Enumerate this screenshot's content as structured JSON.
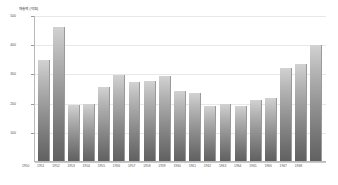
{
  "chart_data": {
    "type": "bar",
    "title": "",
    "xlabel": "",
    "ylabel": "매출액 (억원)",
    "ylim": [
      0,
      500
    ],
    "grid": true,
    "legend": "none",
    "yticks": [
      500,
      400,
      300,
      200,
      100
    ],
    "categories": [
      "1950",
      "1951",
      "1952",
      "1953",
      "1954",
      "1955",
      "1956",
      "1957",
      "1958",
      "1959",
      "1960",
      "1961",
      "1962",
      "1963",
      "1964",
      "1965",
      "1966",
      "1967",
      "1968"
    ],
    "values": [
      350,
      462,
      192,
      198,
      255,
      297,
      272,
      275,
      292,
      240,
      233,
      190,
      196,
      190,
      212,
      218,
      322,
      334,
      400
    ],
    "colors": {
      "bar_top": "#d2d2d2",
      "bar_bottom": "#616161",
      "gridline": "#e8e8e8",
      "axis": "#b9b9b9",
      "text": "#555555",
      "background": "#ffffff"
    }
  }
}
